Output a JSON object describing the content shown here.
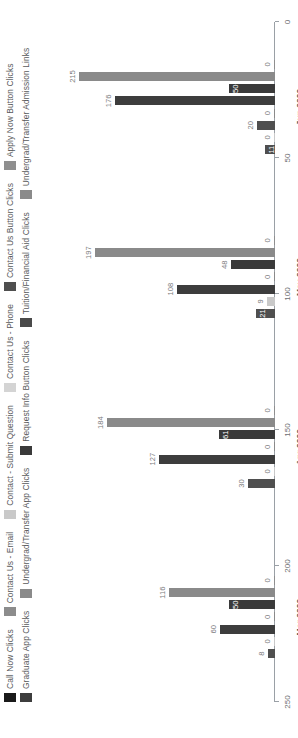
{
  "chart_data": {
    "type": "bar",
    "title": "",
    "xlabel": "",
    "ylabel": "",
    "orientation": "vertical-rotated",
    "grid": false,
    "legend_position": "top-left",
    "ylim": [
      0,
      250
    ],
    "yticks": [
      "250",
      "200",
      "150",
      "100",
      "50",
      "0"
    ],
    "ytick_values": [
      250,
      200,
      150,
      100,
      50,
      0
    ],
    "categories": [
      "Mar 2020",
      "Apr 2020",
      "May 2020",
      "Jun 2020"
    ],
    "series": [
      {
        "name": "Call Now Clicks",
        "color": "#1a1a1a",
        "values": [
          0,
          0,
          0,
          0
        ]
      },
      {
        "name": "Contact Us - Email",
        "color": "#8c8c8c",
        "values": [
          0,
          0,
          0,
          0
        ]
      },
      {
        "name": "Contact - Submit Question",
        "color": "#c9c9c9",
        "values": [
          0,
          0,
          0,
          0
        ]
      },
      {
        "name": "Contact Us - Phone",
        "color": "#d4d4d4",
        "values": [
          0,
          5,
          9,
          11
        ]
      },
      {
        "name": "Contact Us Button Clicks",
        "color": "#4f4f4f",
        "values": [
          8,
          30,
          21,
          20
        ]
      },
      {
        "name": "Apply Now Button Clicks",
        "color": "#8f8f8f",
        "values": [
          0,
          0,
          0,
          0
        ]
      },
      {
        "name": "Graduate App Clicks",
        "color": "#3d3d3d",
        "values": [
          60,
          127,
          108,
          176
        ]
      },
      {
        "name": "Undergrad/Transfer App Clicks",
        "color": "#8a8a8a",
        "values": [
          0,
          0,
          0,
          0
        ]
      },
      {
        "name": "Request Info Button Clicks",
        "color": "#3a3a3a",
        "values": [
          50,
          61,
          48,
          50
        ]
      },
      {
        "name": "Tuition/Financial Aid Clicks",
        "color": "#4a4a4a",
        "values": [
          0,
          0,
          0,
          0
        ]
      },
      {
        "name": "Undergrad/Transfer Admission Links",
        "color": "#8a8a8a",
        "values": [
          116,
          184,
          197,
          215
        ]
      }
    ],
    "bars": [
      {
        "group": "Mar 2020",
        "label": "8",
        "value": 8,
        "color": "#4f4f4f",
        "inside": false
      },
      {
        "group": "Mar 2020",
        "label": "0",
        "value": 0,
        "color": "#c9c9c9",
        "inside": false
      },
      {
        "group": "Mar 2020",
        "label": "60",
        "value": 60,
        "color": "#3d3d3d",
        "inside": false
      },
      {
        "group": "Mar 2020",
        "label": "0",
        "value": 0,
        "color": "#8a8a8a",
        "inside": false
      },
      {
        "group": "Mar 2020",
        "label": "50",
        "value": 50,
        "color": "#3a3a3a",
        "inside": true
      },
      {
        "group": "Mar 2020",
        "label": "116",
        "value": 116,
        "color": "#8a8a8a",
        "inside": false
      },
      {
        "group": "Mar 2020",
        "label": "0",
        "value": 0,
        "color": "#8f8f8f",
        "inside": false
      },
      {
        "group": "Apr 2020",
        "label": "30",
        "value": 30,
        "color": "#4f4f4f",
        "inside": false
      },
      {
        "group": "Apr 2020",
        "label": "0",
        "value": 0,
        "color": "#c9c9c9",
        "inside": false
      },
      {
        "group": "Apr 2020",
        "label": "127",
        "value": 127,
        "color": "#3d3d3d",
        "inside": false
      },
      {
        "group": "Apr 2020",
        "label": "0",
        "value": 0,
        "color": "#8a8a8a",
        "inside": false
      },
      {
        "group": "Apr 2020",
        "label": "61",
        "value": 61,
        "color": "#3a3a3a",
        "inside": true
      },
      {
        "group": "Apr 2020",
        "label": "184",
        "value": 184,
        "color": "#8a8a8a",
        "inside": false
      },
      {
        "group": "Apr 2020",
        "label": "0",
        "value": 0,
        "color": "#8f8f8f",
        "inside": false
      },
      {
        "group": "May 2020",
        "label": "21",
        "value": 21,
        "color": "#4f4f4f",
        "inside": true
      },
      {
        "group": "May 2020",
        "label": "9",
        "value": 9,
        "color": "#c9c9c9",
        "inside": false
      },
      {
        "group": "May 2020",
        "label": "108",
        "value": 108,
        "color": "#3d3d3d",
        "inside": false
      },
      {
        "group": "May 2020",
        "label": "0",
        "value": 0,
        "color": "#8a8a8a",
        "inside": false
      },
      {
        "group": "May 2020",
        "label": "48",
        "value": 48,
        "color": "#3a3a3a",
        "inside": false
      },
      {
        "group": "May 2020",
        "label": "197",
        "value": 197,
        "color": "#8a8a8a",
        "inside": false
      },
      {
        "group": "May 2020",
        "label": "0",
        "value": 0,
        "color": "#8f8f8f",
        "inside": false
      },
      {
        "group": "Jun 2020",
        "label": "11",
        "value": 11,
        "color": "#4f4f4f",
        "inside": true
      },
      {
        "group": "Jun 2020",
        "label": "0",
        "value": 0,
        "color": "#c9c9c9",
        "inside": false
      },
      {
        "group": "Jun 2020",
        "label": "20",
        "value": 20,
        "color": "#4f4f4f",
        "inside": false
      },
      {
        "group": "Jun 2020",
        "label": "0",
        "value": 0,
        "color": "#8a8a8a",
        "inside": false
      },
      {
        "group": "Jun 2020",
        "label": "176",
        "value": 176,
        "color": "#3d3d3d",
        "inside": false
      },
      {
        "group": "Jun 2020",
        "label": "50",
        "value": 50,
        "color": "#3a3a3a",
        "inside": true
      },
      {
        "group": "Jun 2020",
        "label": "215",
        "value": 215,
        "color": "#8a8a8a",
        "inside": false
      },
      {
        "group": "Jun 2020",
        "label": "0",
        "value": 0,
        "color": "#8f8f8f",
        "inside": false
      }
    ]
  },
  "legend": {
    "rows": [
      [
        {
          "label": "Call Now Clicks",
          "color": "#1a1a1a"
        },
        {
          "label": "Contact Us - Email",
          "color": "#8c8c8c"
        },
        {
          "label": "Contact - Submit Question",
          "color": "#c9c9c9"
        },
        {
          "label": "Contact Us - Phone",
          "color": "#d4d4d4"
        },
        {
          "label": "Contact Us Button Clicks",
          "color": "#4f4f4f"
        },
        {
          "label": "Apply Now Button Clicks",
          "color": "#8f8f8f"
        }
      ],
      [
        {
          "label": "Graduate App Clicks",
          "color": "#3d3d3d"
        },
        {
          "label": "Undergrad/Transfer App Clicks",
          "color": "#8a8a8a"
        },
        {
          "label": "Request Info Button Clicks",
          "color": "#3a3a3a"
        },
        {
          "label": "Tuition/Financial Aid Clicks",
          "color": "#4a4a4a"
        },
        {
          "label": "Undergrad/Transfer Admission Links",
          "color": "#8a8a8a"
        }
      ]
    ]
  }
}
